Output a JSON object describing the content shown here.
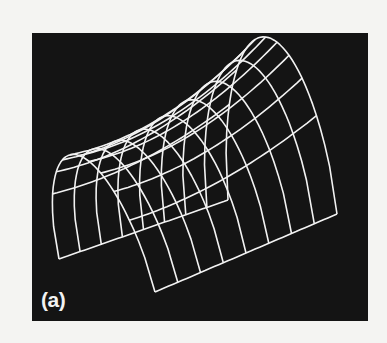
{
  "figure": {
    "panel_label": "(a)",
    "background_color": "#141414",
    "line_color": "#f2f2f2",
    "page_color": "#f4f4f2",
    "grid": {
      "u_lines": 9,
      "v_lines": 11
    }
  }
}
